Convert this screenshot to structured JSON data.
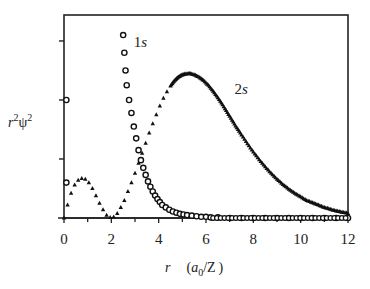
{
  "chart_data": {
    "type": "scatter",
    "title": "",
    "xlabel": "r (a0/Z)",
    "xlabel_parts": {
      "var": "r",
      "unit_open": "(",
      "unit_a": "a",
      "unit_sub": "0",
      "unit_rest": "/Z",
      "unit_close": ")"
    },
    "ylabel": "r²ψ²",
    "ylabel_parts": {
      "r": "r",
      "sup1": "2",
      "psi": "ψ",
      "sup2": "2"
    },
    "xlim": [
      0,
      12
    ],
    "ylim": [
      0,
      3.44
    ],
    "x_ticks": [
      0,
      2,
      4,
      6,
      8,
      10,
      12
    ],
    "x_tick_labels": [
      "0",
      "2",
      "4",
      "6",
      "8",
      "10",
      "12"
    ],
    "y_ticks": [
      1,
      2,
      3
    ],
    "y_tick_labels": [],
    "grid": false,
    "legend": "inline labels",
    "series": [
      {
        "name": "1s",
        "marker": "open-circle",
        "label_pos": {
          "x": 2.95,
          "y": 2.9
        },
        "x": [
          0.1,
          0.1,
          2.5,
          2.55,
          2.6,
          2.65,
          2.75,
          2.85,
          2.95,
          3.05,
          3.15,
          3.25,
          3.35,
          3.45,
          3.55,
          3.65,
          3.75,
          3.85,
          3.95,
          4.05,
          4.15,
          4.3,
          4.45,
          4.6,
          4.75,
          4.9,
          5.05,
          5.2,
          5.4,
          5.6,
          5.8,
          6.0,
          6.2,
          6.5,
          7.0,
          7.5,
          8.0,
          8.5,
          9.0,
          9.5,
          10.0,
          10.5,
          11.0,
          11.5,
          12.0
        ],
        "values": [
          2.0,
          0.6,
          3.1,
          2.8,
          2.5,
          2.25,
          2.0,
          1.78,
          1.55,
          1.35,
          1.15,
          0.98,
          0.85,
          0.73,
          0.62,
          0.53,
          0.45,
          0.38,
          0.32,
          0.27,
          0.22,
          0.18,
          0.14,
          0.11,
          0.09,
          0.07,
          0.06,
          0.05,
          0.04,
          0.03,
          0.02,
          0.02,
          0.01,
          0.01,
          0.0,
          0.0,
          0.0,
          0.0,
          0.0,
          0.0,
          0.0,
          0.0,
          0.0,
          0.0,
          0.0
        ]
      },
      {
        "name": "2s",
        "marker": "filled-triangle",
        "label_pos": {
          "x": 7.2,
          "y": 2.1
        },
        "x": [
          0.0,
          0.15,
          0.3,
          0.45,
          0.6,
          0.75,
          0.9,
          1.05,
          1.2,
          1.35,
          1.5,
          1.65,
          1.8,
          1.95,
          2.1,
          2.25,
          2.4,
          2.55,
          2.7,
          2.85,
          3.0,
          3.15,
          3.3,
          3.45,
          3.6,
          3.75,
          3.9,
          4.05,
          4.2,
          4.35,
          4.5,
          4.65,
          4.8,
          4.95,
          5.1,
          5.3,
          5.5,
          5.7,
          5.9,
          6.1,
          6.3,
          6.5,
          6.7,
          6.9,
          7.1,
          7.3,
          7.5,
          7.75,
          8.0,
          8.25,
          8.5,
          8.75,
          9.0,
          9.25,
          9.5,
          9.75,
          10.0,
          10.25,
          10.5,
          10.75,
          11.0,
          11.25,
          11.5,
          11.75,
          12.0
        ],
        "values": [
          0.0,
          0.22,
          0.42,
          0.56,
          0.64,
          0.67,
          0.66,
          0.6,
          0.5,
          0.38,
          0.25,
          0.14,
          0.05,
          0.01,
          0.02,
          0.08,
          0.18,
          0.3,
          0.45,
          0.6,
          0.76,
          0.93,
          1.1,
          1.27,
          1.44,
          1.6,
          1.75,
          1.9,
          2.03,
          2.14,
          2.24,
          2.32,
          2.38,
          2.42,
          2.44,
          2.45,
          2.43,
          2.39,
          2.33,
          2.25,
          2.15,
          2.04,
          1.92,
          1.79,
          1.66,
          1.53,
          1.41,
          1.26,
          1.12,
          0.99,
          0.87,
          0.76,
          0.66,
          0.57,
          0.49,
          0.42,
          0.36,
          0.3,
          0.26,
          0.22,
          0.18,
          0.15,
          0.12,
          0.1,
          0.08
        ]
      }
    ]
  }
}
